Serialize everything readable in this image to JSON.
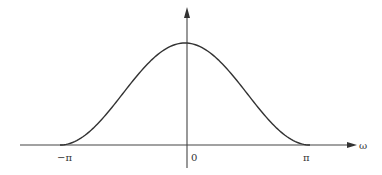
{
  "chart_data": {
    "type": "line",
    "title": "",
    "xlabel": "ω",
    "ylabel": "",
    "x_tick_labels": [
      "−π",
      "0",
      "π"
    ],
    "x_tick_values": [
      -3.14159,
      0,
      3.14159
    ],
    "xlim": [
      -3.14159,
      3.14159
    ],
    "ylim": [
      0,
      1
    ],
    "grid": false,
    "legend": null,
    "series": [
      {
        "name": "raised-cosine window spectrum",
        "function": "(1 + cos(ω)) / 2",
        "x": [
          -3.14159,
          -2.618,
          -2.094,
          -1.571,
          -1.047,
          -0.524,
          0,
          0.524,
          1.047,
          1.571,
          2.094,
          2.618,
          3.14159
        ],
        "values": [
          0.0,
          0.067,
          0.25,
          0.5,
          0.75,
          0.933,
          1.0,
          0.933,
          0.75,
          0.5,
          0.25,
          0.067,
          0.0
        ]
      }
    ]
  },
  "axes": {
    "x_label": "ω",
    "ticks": {
      "neg_pi": "−π",
      "zero": "0",
      "pi": "π"
    }
  },
  "colors": {
    "line": "#333333",
    "axis": "#444444",
    "background": "#ffffff"
  }
}
